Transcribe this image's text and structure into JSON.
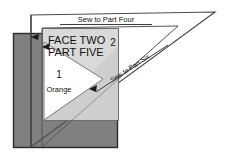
{
  "diagram": {
    "title_line_1": "FACE TWO",
    "title_line_2": "PART FIVE",
    "labels": {
      "piece_one_number": "1",
      "piece_one_fabric": "Orange",
      "piece_two_number": "2",
      "sew_top": "Sew to Part Four",
      "sew_diagonal": "Sew to Part Six"
    },
    "colors": {
      "background": "#ffffff",
      "dark_panel": "#808080",
      "light_panel": "#d9d9d9",
      "white_piece": "#ffffff",
      "outline": "#333333",
      "text": "#111111"
    }
  }
}
